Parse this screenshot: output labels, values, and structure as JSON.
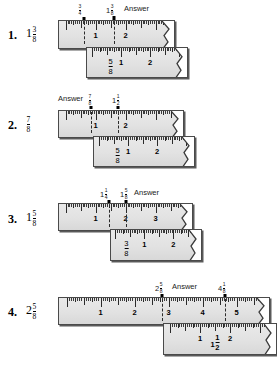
{
  "page": {
    "background_color": "#ffffff",
    "ruler_face_color": "#e4e4e4",
    "ruler_edge_color": "#4a4a4a",
    "answer_label": "Answer"
  },
  "problems": [
    {
      "index": "1.",
      "lead_whole": "1",
      "lead_num": "3",
      "lead_den": "8",
      "answer_label": "Answer",
      "callouts": [
        {
          "whole": "",
          "num": "3",
          "den": "4"
        },
        {
          "whole": "1",
          "num": "3",
          "den": "8"
        }
      ],
      "top_ruler_labels": [
        "1",
        "2"
      ],
      "bottom_ruler_labels": [
        {
          "whole": "",
          "num": "5",
          "den": "8"
        },
        {
          "whole": "1",
          "num": "",
          "den": ""
        },
        {
          "whole": "2",
          "num": "",
          "den": ""
        }
      ]
    },
    {
      "index": "2.",
      "lead_whole": "",
      "lead_num": "7",
      "lead_den": "8",
      "answer_label": "Answer",
      "callouts": [
        {
          "whole": "",
          "num": "7",
          "den": "8"
        },
        {
          "whole": "1",
          "num": "1",
          "den": "2"
        }
      ],
      "top_ruler_labels": [
        "1",
        "2"
      ],
      "bottom_ruler_labels": [
        {
          "whole": "",
          "num": "5",
          "den": "8"
        },
        {
          "whole": "1",
          "num": "",
          "den": ""
        },
        {
          "whole": "2",
          "num": "",
          "den": ""
        }
      ]
    },
    {
      "index": "3.",
      "lead_whole": "1",
      "lead_num": "5",
      "lead_den": "8",
      "answer_label": "Answer",
      "callouts": [
        {
          "whole": "1",
          "num": "1",
          "den": "4"
        },
        {
          "whole": "1",
          "num": "5",
          "den": "8"
        }
      ],
      "top_ruler_labels": [
        "1",
        "2",
        "3"
      ],
      "bottom_ruler_labels": [
        {
          "whole": "",
          "num": "3",
          "den": "8"
        },
        {
          "whole": "1",
          "num": "",
          "den": ""
        },
        {
          "whole": "2",
          "num": "",
          "den": ""
        }
      ]
    },
    {
      "index": "4.",
      "lead_whole": "2",
      "lead_num": "5",
      "lead_den": "8",
      "answer_label": "Answer",
      "callouts": [
        {
          "whole": "2",
          "num": "5",
          "den": "8"
        },
        {
          "whole": "4",
          "num": "1",
          "den": "8"
        }
      ],
      "top_ruler_labels": [
        "1",
        "2",
        "3",
        "4",
        "5"
      ],
      "bottom_ruler_labels": [
        {
          "whole": "1",
          "num": "",
          "den": ""
        },
        {
          "whole": "1",
          "num": "1",
          "den": "2"
        },
        {
          "whole": "2",
          "num": "",
          "den": ""
        }
      ]
    }
  ]
}
